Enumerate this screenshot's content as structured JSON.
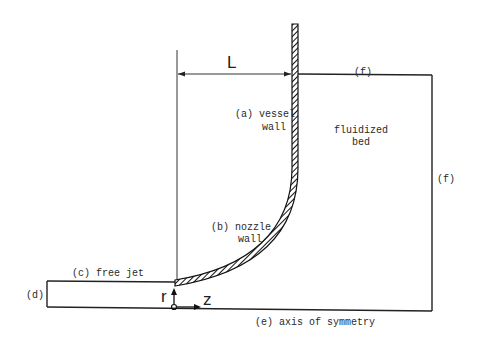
{
  "diagram": {
    "type": "schematic",
    "dimension": {
      "label": "L"
    },
    "regions": {
      "vessel_wall": {
        "tag": "(a)",
        "line1": "(a) vessel",
        "line2": "wall"
      },
      "nozzle_wall": {
        "tag": "(b)",
        "line1": "(b) nozzle",
        "line2": "wall"
      },
      "free_jet": {
        "tag": "(c)",
        "label": "(c) free jet"
      },
      "inlet": {
        "tag": "(d)",
        "label": "(d)"
      },
      "axis": {
        "tag": "(e)",
        "label": "(e) axis of symmetry"
      },
      "top_boundary": {
        "tag": "(f)",
        "label": "(f)"
      },
      "right_boundary": {
        "tag": "(f)",
        "label": "(f)"
      },
      "bed": {
        "line1": "fluidized",
        "line2": "bed"
      }
    },
    "coordinates": {
      "r_label": "r",
      "z_label": "z"
    },
    "colors": {
      "line": "#222222",
      "background": "#ffffff"
    }
  }
}
